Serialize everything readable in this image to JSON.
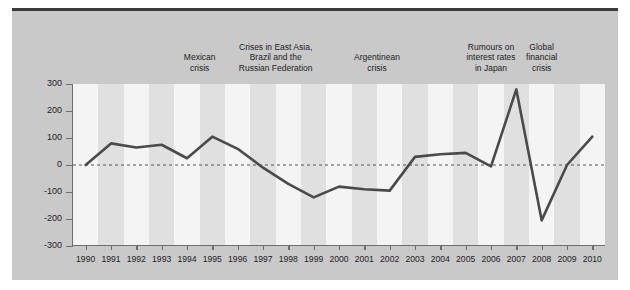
{
  "chart_data": {
    "type": "line",
    "title": "",
    "xlabel": "",
    "ylabel": "",
    "ylim": [
      -300,
      300
    ],
    "ytick_labels": [
      "300",
      "200",
      "100",
      "0",
      "-100",
      "-200",
      "-300"
    ],
    "ytick_values": [
      300,
      200,
      100,
      0,
      -100,
      -200,
      -300
    ],
    "grid": false,
    "legend": "none",
    "zero_line": true,
    "categories": [
      "1990",
      "1991",
      "1992",
      "1993",
      "1994",
      "1995",
      "1996",
      "1997",
      "1998",
      "1999",
      "2000",
      "2001",
      "2002",
      "2003",
      "2004",
      "2005",
      "2006",
      "2007",
      "2008",
      "2009",
      "2010"
    ],
    "values": [
      0,
      80,
      65,
      75,
      25,
      105,
      60,
      -10,
      -70,
      -120,
      -80,
      -90,
      -95,
      30,
      40,
      45,
      -5,
      280,
      -205,
      0,
      105
    ],
    "series": [
      {
        "name": "net flow",
        "values": [
          0,
          80,
          65,
          75,
          25,
          105,
          60,
          -10,
          -70,
          -120,
          -80,
          -90,
          -95,
          30,
          40,
          45,
          -5,
          280,
          -205,
          0,
          105
        ]
      }
    ],
    "annotations": [
      {
        "label": "Mexican\ncrisis",
        "line1": "Mexican",
        "line2": "crisis",
        "line3": "",
        "start_year": 1994,
        "end_year": 1995,
        "center_year": 1994.5
      },
      {
        "label": "Crises in East Asia,\nBrazil and the\nRussian Federation",
        "line1": "Crises in East Asia,",
        "line2": "Brazil and the",
        "line3": "Russian Federation",
        "start_year": 1997,
        "end_year": 1998,
        "center_year": 1997.5
      },
      {
        "label": "Argentinean\ncrisis",
        "line1": "Argentinean",
        "line2": "crisis",
        "line3": "",
        "start_year": 2001,
        "end_year": 2002,
        "center_year": 2001.5
      },
      {
        "label": "Rumours on\ninterest rates\nin Japan",
        "line1": "Rumours on",
        "line2": "interest rates",
        "line3": "in Japan",
        "start_year": 2006,
        "end_year": 2006,
        "center_year": 2006.0
      },
      {
        "label": "Global\nfinancial\ncrisis",
        "line1": "Global",
        "line2": "financial",
        "line3": "crisis",
        "start_year": 2008,
        "end_year": 2008,
        "center_year": 2008.0
      }
    ],
    "colors": {
      "line": "#4a4a4a",
      "zero_line": "#555555",
      "band": "#e0e0e0",
      "plot_background": "#f4f4f4",
      "frame_background": "#c9c9c9",
      "axis": "#6f6f6f",
      "text": "#1d1d1d"
    }
  }
}
